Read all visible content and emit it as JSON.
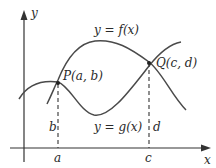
{
  "diagram": {
    "axes": {
      "x_label": "x",
      "y_label": "y"
    },
    "curves": [
      {
        "name": "f",
        "label": "y = f(x)"
      },
      {
        "name": "g",
        "label": "y = g(x)"
      }
    ],
    "points": [
      {
        "name": "P",
        "label": "P(a, b)"
      },
      {
        "name": "Q",
        "label": "Q(c, d)"
      }
    ],
    "tick_labels": {
      "a": "a",
      "c": "c"
    },
    "segment_labels": {
      "b": "b",
      "d": "d"
    },
    "colors": {
      "curve": "#4a4a4a",
      "axis": "#333333",
      "text": "#2a2a2a"
    }
  }
}
